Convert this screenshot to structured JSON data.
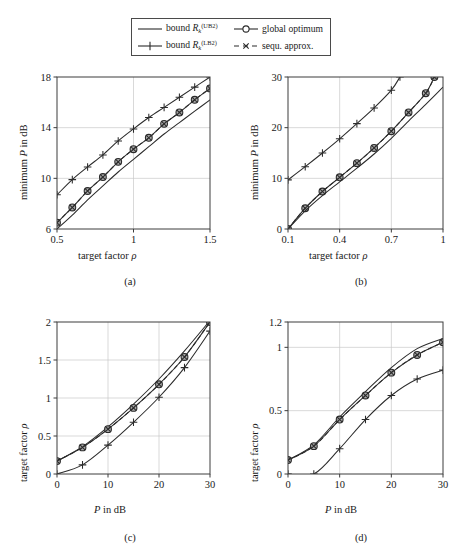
{
  "figure": {
    "background": "#ffffff",
    "axis_color": "#3c3c3c",
    "grid_color": "#c8c8c8",
    "curve_color": "#2b2b2b",
    "marker_fill": "#9a9a9a"
  },
  "legend": {
    "entries": [
      {
        "id": "bound-ub2",
        "label_prefix": "bound ",
        "symbol": "R",
        "subscript": "k",
        "superscript": "(UB2)",
        "style": "solid-line",
        "marker": "none"
      },
      {
        "id": "global-optimum",
        "label": "global optimum",
        "style": "solid-line",
        "marker": "circle"
      },
      {
        "id": "bound-lb2",
        "label_prefix": "bound ",
        "symbol": "R",
        "subscript": "k",
        "superscript": "(LB2)",
        "style": "solid-line",
        "marker": "plus"
      },
      {
        "id": "sequ-approx",
        "label": "sequ. approx.",
        "style": "dashed-line",
        "marker": "x"
      }
    ]
  },
  "chart_data": [
    {
      "id": "subplot-a",
      "type": "line",
      "caption": "(a)",
      "title": "",
      "xlabel": "target factor ρ",
      "ylabel": "minimum P in dB",
      "xlim": [
        0.5,
        1.5
      ],
      "ylim": [
        6,
        18
      ],
      "xticks": [
        0.5,
        1,
        1.5
      ],
      "xticklabels": [
        "0.5",
        "1",
        "1.5"
      ],
      "yticks": [
        6,
        10,
        14,
        18
      ],
      "yticklabels": [
        "6",
        "10",
        "14",
        "18"
      ],
      "grid": true,
      "legend_position": "external-top",
      "series": [
        {
          "name": "bound R_k^(LB2)",
          "style": "solid",
          "marker": "plus",
          "x": [
            0.5,
            0.6,
            0.7,
            0.8,
            0.9,
            1.0,
            1.1,
            1.2,
            1.3,
            1.4,
            1.5
          ],
          "y": [
            8.7,
            9.9,
            10.9,
            11.85,
            12.95,
            13.9,
            14.8,
            15.6,
            16.4,
            17.2,
            18.0
          ]
        },
        {
          "name": "global optimum",
          "style": "solid",
          "marker": "circle",
          "x": [
            0.5,
            0.6,
            0.7,
            0.8,
            0.9,
            1.0,
            1.1,
            1.2,
            1.3,
            1.4,
            1.5
          ],
          "y": [
            6.5,
            7.7,
            9.0,
            10.1,
            11.3,
            12.3,
            13.2,
            14.3,
            15.2,
            16.2,
            17.1
          ]
        },
        {
          "name": "sequ. approx.",
          "style": "dashed",
          "marker": "x",
          "x": [
            0.5,
            0.6,
            0.7,
            0.8,
            0.9,
            1.0,
            1.1,
            1.2,
            1.3,
            1.4,
            1.5
          ],
          "y": [
            6.5,
            7.7,
            9.0,
            10.1,
            11.3,
            12.3,
            13.2,
            14.3,
            15.2,
            16.2,
            17.1
          ]
        },
        {
          "name": "bound R_k^(UB2)",
          "style": "solid",
          "marker": "none",
          "x": [
            0.5,
            0.6,
            0.7,
            0.8,
            0.9,
            1.0,
            1.1,
            1.2,
            1.3,
            1.4,
            1.5
          ],
          "y": [
            6.0,
            7.1,
            8.3,
            9.4,
            10.5,
            11.5,
            12.5,
            13.5,
            14.4,
            15.3,
            16.2
          ]
        }
      ]
    },
    {
      "id": "subplot-b",
      "type": "line",
      "caption": "(b)",
      "title": "",
      "xlabel": "target factor ρ",
      "ylabel": "minimum P in dB",
      "xlim": [
        0.1,
        1.0
      ],
      "ylim": [
        0,
        30
      ],
      "xticks": [
        0.1,
        0.4,
        0.7,
        1.0
      ],
      "xticklabels": [
        "0.1",
        "0.4",
        "0.7",
        "1"
      ],
      "yticks": [
        0,
        10,
        20,
        30
      ],
      "yticklabels": [
        "0",
        "10",
        "20",
        "30"
      ],
      "grid": true,
      "legend_position": "external-top",
      "series": [
        {
          "name": "bound R_k^(LB2)",
          "style": "solid",
          "marker": "plus",
          "x": [
            0.1,
            0.2,
            0.3,
            0.4,
            0.5,
            0.6,
            0.7,
            0.75
          ],
          "y": [
            9.7,
            12.3,
            15.0,
            17.8,
            20.8,
            23.9,
            27.4,
            30.0
          ]
        },
        {
          "name": "global optimum",
          "style": "solid",
          "marker": "circle",
          "x": [
            0.1,
            0.2,
            0.3,
            0.4,
            0.5,
            0.6,
            0.7,
            0.8,
            0.9,
            0.95
          ],
          "y": [
            0.0,
            4.1,
            7.4,
            10.2,
            13.0,
            16.0,
            19.3,
            23.0,
            26.8,
            30.0
          ]
        },
        {
          "name": "sequ. approx.",
          "style": "dashed",
          "marker": "x",
          "x": [
            0.1,
            0.2,
            0.3,
            0.4,
            0.5,
            0.6,
            0.7,
            0.8,
            0.9,
            0.95
          ],
          "y": [
            0.0,
            4.1,
            7.4,
            10.2,
            13.0,
            16.0,
            19.3,
            23.0,
            26.8,
            30.0
          ]
        },
        {
          "name": "bound R_k^(UB2)",
          "style": "solid",
          "marker": "none",
          "x": [
            0.1,
            0.2,
            0.3,
            0.4,
            0.5,
            0.6,
            0.7,
            0.8,
            0.9,
            1.0
          ],
          "y": [
            0.0,
            3.6,
            6.6,
            9.3,
            12.0,
            14.8,
            17.9,
            21.3,
            24.6,
            28.0
          ]
        }
      ]
    },
    {
      "id": "subplot-c",
      "type": "line",
      "caption": "(c)",
      "title": "",
      "xlabel": "P in dB",
      "ylabel": "target factor ρ",
      "xlim": [
        0,
        30
      ],
      "ylim": [
        0,
        2
      ],
      "xticks": [
        0,
        10,
        20,
        30
      ],
      "xticklabels": [
        "0",
        "10",
        "20",
        "30"
      ],
      "yticks": [
        0,
        0.5,
        1,
        1.5,
        2
      ],
      "yticklabels": [
        "0",
        "0.5",
        "1",
        "1.5",
        "2"
      ],
      "grid": true,
      "legend_position": "external-top",
      "series": [
        {
          "name": "bound R_k^(UB2)",
          "style": "solid",
          "marker": "none",
          "x": [
            0,
            5,
            10,
            15,
            20,
            25,
            30
          ],
          "y": [
            0.17,
            0.36,
            0.62,
            0.92,
            1.25,
            1.62,
            2.02
          ]
        },
        {
          "name": "global optimum",
          "style": "solid",
          "marker": "circle",
          "x": [
            0,
            5,
            10,
            15,
            20,
            25,
            30
          ],
          "y": [
            0.17,
            0.35,
            0.59,
            0.87,
            1.18,
            1.54,
            2.0
          ]
        },
        {
          "name": "sequ. approx.",
          "style": "dashed",
          "marker": "x",
          "x": [
            0,
            5,
            10,
            15,
            20,
            25,
            30
          ],
          "y": [
            0.17,
            0.35,
            0.59,
            0.87,
            1.18,
            1.54,
            2.0
          ]
        },
        {
          "name": "bound R_k^(LB2)",
          "style": "solid",
          "marker": "plus",
          "x": [
            0,
            5,
            10,
            15,
            20,
            25,
            30
          ],
          "y": [
            0.0,
            0.12,
            0.38,
            0.68,
            1.01,
            1.4,
            1.88
          ]
        }
      ]
    },
    {
      "id": "subplot-d",
      "type": "line",
      "caption": "(d)",
      "title": "",
      "xlabel": "P in dB",
      "ylabel": "target factor ρ",
      "xlim": [
        0,
        30
      ],
      "ylim": [
        0,
        1.2
      ],
      "xticks": [
        0,
        10,
        20,
        30
      ],
      "xticklabels": [
        "0",
        "10",
        "20",
        "30"
      ],
      "yticks": [
        0,
        0.5,
        1,
        1.2
      ],
      "yticklabels": [
        "0",
        "0.5",
        "1",
        "1.2"
      ],
      "grid": true,
      "legend_position": "external-top",
      "series": [
        {
          "name": "bound R_k^(UB2)",
          "style": "solid",
          "marker": "none",
          "x": [
            0,
            5,
            10,
            15,
            20,
            25,
            30
          ],
          "y": [
            0.11,
            0.23,
            0.45,
            0.65,
            0.84,
            0.99,
            1.07
          ]
        },
        {
          "name": "global optimum",
          "style": "solid",
          "marker": "circle",
          "x": [
            0,
            5,
            10,
            15,
            20,
            25,
            30
          ],
          "y": [
            0.11,
            0.22,
            0.43,
            0.62,
            0.8,
            0.94,
            1.04
          ]
        },
        {
          "name": "sequ. approx.",
          "style": "dashed",
          "marker": "x",
          "x": [
            0,
            5,
            10,
            15,
            20,
            25,
            30
          ],
          "y": [
            0.11,
            0.22,
            0.43,
            0.62,
            0.8,
            0.94,
            1.04
          ]
        },
        {
          "name": "bound R_k^(LB2)",
          "style": "solid",
          "marker": "plus",
          "x": [
            0,
            5,
            10,
            15,
            20,
            25,
            30
          ],
          "y": [
            0.0,
            0.0,
            0.2,
            0.43,
            0.62,
            0.75,
            0.82
          ]
        }
      ]
    }
  ]
}
